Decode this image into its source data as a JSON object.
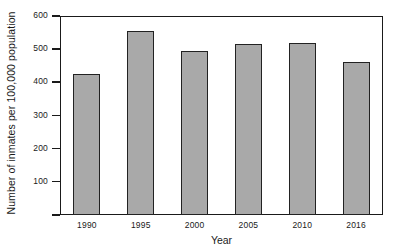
{
  "chart_data": {
    "type": "bar",
    "title": "",
    "xlabel": "Year",
    "ylabel": "Number of inmates per 100,000 population",
    "categories": [
      "1990",
      "1995",
      "2000",
      "2005",
      "2010",
      "2016"
    ],
    "values": [
      425,
      555,
      495,
      515,
      520,
      460
    ],
    "ylim": [
      0,
      600
    ],
    "ytick_labels": [
      "600",
      "500",
      "400",
      "300",
      "200",
      "100",
      ""
    ],
    "ytick_values": [
      600,
      500,
      400,
      300,
      200,
      100,
      0
    ],
    "grid": false,
    "legend": "none",
    "bar_fill_color": "#a9a9a9",
    "bar_edge_color": "#222222",
    "axis_color": "#1a1a1a",
    "background_color": "#ffffff"
  }
}
